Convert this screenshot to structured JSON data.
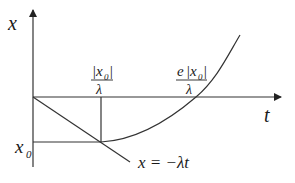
{
  "diagram": {
    "axes": {
      "vertical_label": "x",
      "horizontal_label": "t"
    },
    "labels": {
      "x0": "x",
      "x0_sub": "0",
      "tick1_num": "|x",
      "tick1_num_sub": "0",
      "tick1_num_close": "|",
      "tick1_den": "λ",
      "tick2_num_e": "e",
      "tick2_num": "|x",
      "tick2_num_sub": "0",
      "tick2_num_close": "|",
      "tick2_den": "λ",
      "line_eq": "x = −λt"
    },
    "colors": {
      "line": "#333333",
      "text": "#1a1a1a",
      "background": "#ffffff"
    }
  }
}
